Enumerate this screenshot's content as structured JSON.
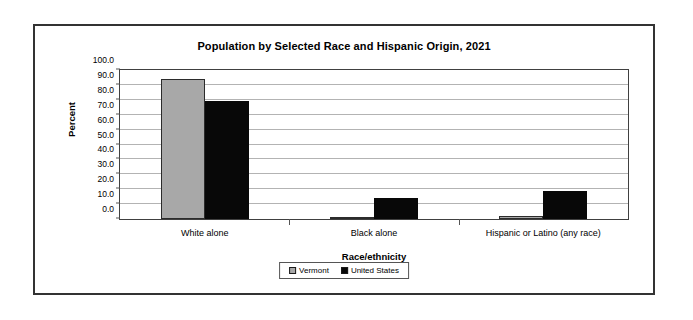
{
  "chart_data": {
    "type": "bar",
    "title": "Population by Selected Race and Hispanic Origin, 2021",
    "xlabel": "Race/ethnicity",
    "ylabel": "Percent",
    "categories": [
      "White alone",
      "Black alone",
      "Hispanic or Latino (any race)"
    ],
    "series": [
      {
        "name": "Vermont",
        "color": "#a8a8a8",
        "values": [
          94.0,
          1.5,
          2.3
        ]
      },
      {
        "name": "United States",
        "color": "#080808",
        "values": [
          79.0,
          14.0,
          19.0
        ]
      }
    ],
    "ylim": [
      0.0,
      100.0
    ],
    "ytick_step": 10.0,
    "ytick_labels": [
      "100.0",
      "90.0",
      "80.0",
      "70.0",
      "60.0",
      "50.0",
      "40.0",
      "30.0",
      "20.0",
      "10.0",
      "0.0"
    ],
    "grid": true,
    "legend_position": "bottom-center"
  },
  "legend": {
    "entries": [
      {
        "label": "Vermont"
      },
      {
        "label": "United States"
      }
    ]
  }
}
